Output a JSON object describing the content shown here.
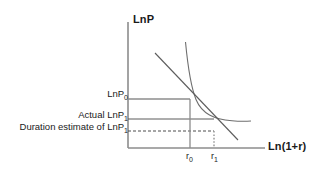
{
  "figure": {
    "type": "economics-diagram"
  },
  "axes": {
    "y_title": "LnP",
    "x_title": "Ln(1+r)",
    "origin": {
      "x": 128,
      "y": 148
    },
    "y_top": 22,
    "x_right": 265,
    "color": "#8c8c8c"
  },
  "y_labels": [
    {
      "id": "lnp0",
      "text": "LnP",
      "sub": "0",
      "y": 99,
      "line_style": "solid-thick",
      "line_color": "#8c8c8c",
      "line_x_end": 190
    },
    {
      "id": "actual_lnp1",
      "text": "Actual LnP",
      "sub": "1",
      "y": 119,
      "line_style": "solid-thin",
      "line_color": "#5a5a5a",
      "line_x_end": 214
    },
    {
      "id": "duration_lnp1",
      "text": "Duration estimate of LnP",
      "sub": "1",
      "y": 131,
      "line_style": "dashed",
      "line_color": "#4d4d4d",
      "line_x_end": 214
    }
  ],
  "x_ticks": [
    {
      "id": "r0",
      "text": "r",
      "sub": "0",
      "x": 190,
      "line_style": "solid",
      "line_color": "#8c8c8c",
      "line_y_top": 99
    },
    {
      "id": "r1",
      "text": "r",
      "sub": "1",
      "x": 214,
      "line_style": "dotted",
      "line_color": "#9a9a9a",
      "line_y_top": 131
    }
  ],
  "curves": [
    {
      "name": "price-yield-curve",
      "style": "convex",
      "color": "#6e6e6e",
      "width": 1.1,
      "path": "M 185.5 42 C 187.8 66, 190.5 86, 196 99.5 C 202 114, 214 119, 232 120.8 C 240 121.5, 246 121.4, 251 121"
    },
    {
      "name": "duration-tangent-line",
      "style": "straight",
      "color": "#5d5d5d",
      "width": 1.1,
      "path": "M 155 53 L 238 140"
    }
  ],
  "tangency_point": {
    "x": 190,
    "y": 99
  }
}
